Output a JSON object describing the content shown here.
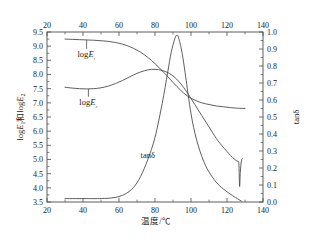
{
  "chart_data": {
    "type": "line",
    "title": "",
    "xlabel": "温度/℃",
    "ylabel": "logE₁和logE₂",
    "y2label": "tanδ",
    "xlim": [
      20,
      140
    ],
    "ylim": [
      3.5,
      9.5
    ],
    "y2lim": [
      0.0,
      1.0
    ],
    "grid": false,
    "legend_position": "inline-annotations",
    "xticks": [
      20,
      40,
      60,
      80,
      100,
      120,
      140
    ],
    "xticklabels": [
      "20",
      "40",
      "60",
      "80",
      "100",
      "120",
      "140"
    ],
    "xminorticks": [
      30,
      50,
      70,
      90,
      110,
      130
    ],
    "yticks": [
      3.5,
      4.0,
      4.5,
      5.0,
      5.5,
      6.0,
      6.5,
      7.0,
      7.5,
      8.0,
      8.5,
      9.0,
      9.5
    ],
    "yticklabels": [
      "3.5",
      "4.0",
      "4.5",
      "5.0",
      "5.5",
      "6.0",
      "6.5",
      "7.0",
      "7.5",
      "8.0",
      "8.5",
      "9.0",
      "9.5"
    ],
    "y2ticks": [
      0.0,
      0.1,
      0.2,
      0.3,
      0.4,
      0.5,
      0.6,
      0.7,
      0.8,
      0.9,
      1.0
    ],
    "y2ticklabels": [
      "0.0",
      "0.1",
      "0.2",
      "0.3",
      "0.4",
      "0.5",
      "0.6",
      "0.7",
      "0.8",
      "0.9",
      "1.0"
    ],
    "top_axis_shown": true,
    "bottom_axis_shown": true,
    "annotations": [
      {
        "text": "logE₁",
        "x": 42,
        "y": 8.62,
        "leader_to_y": 9.22
      },
      {
        "text": "logE₂",
        "x": 43,
        "y": 6.93,
        "leader_to_y": 7.49
      },
      {
        "text": "tanδ",
        "x": 76,
        "y": 5.05
      }
    ],
    "series": [
      {
        "name": "logE₁",
        "axis": "left",
        "x": [
          30,
          34,
          38,
          42,
          46,
          50,
          54,
          58,
          62,
          66,
          70,
          74,
          78,
          82,
          86,
          90,
          94,
          98,
          102,
          106,
          110,
          114,
          118,
          122,
          126,
          130
        ],
        "values": [
          9.25,
          9.24,
          9.23,
          9.22,
          9.21,
          9.19,
          9.17,
          9.13,
          9.07,
          8.98,
          8.86,
          8.7,
          8.5,
          8.26,
          8.0,
          7.72,
          7.46,
          7.24,
          7.1,
          7.0,
          6.94,
          6.89,
          6.86,
          6.83,
          6.81,
          6.8
        ]
      },
      {
        "name": "logE₂",
        "axis": "left",
        "x": [
          30,
          34,
          38,
          42,
          46,
          50,
          54,
          58,
          62,
          66,
          70,
          74,
          78,
          82,
          86,
          90,
          94,
          98,
          102,
          106,
          110,
          114,
          117,
          120,
          122,
          124,
          125,
          126,
          126.6,
          127,
          127.4,
          128,
          128.6
        ],
        "values": [
          7.55,
          7.52,
          7.5,
          7.49,
          7.5,
          7.53,
          7.59,
          7.68,
          7.79,
          7.92,
          8.04,
          8.13,
          8.18,
          8.17,
          8.1,
          7.95,
          7.7,
          7.35,
          6.95,
          6.55,
          6.15,
          5.75,
          5.5,
          5.28,
          5.14,
          5.02,
          4.97,
          4.93,
          4.85,
          4.05,
          4.55,
          4.95,
          5.03
        ]
      },
      {
        "name": "tanδ",
        "axis": "right",
        "x": [
          30,
          36,
          42,
          48,
          52,
          56,
          60,
          64,
          68,
          72,
          76,
          80,
          84,
          87,
          89,
          91,
          92,
          93,
          95,
          97,
          100,
          103,
          107,
          111,
          115,
          119,
          123,
          126,
          128
        ],
        "values": [
          0.02,
          0.02,
          0.02,
          0.02,
          0.021,
          0.024,
          0.032,
          0.05,
          0.085,
          0.15,
          0.25,
          0.38,
          0.58,
          0.76,
          0.88,
          0.96,
          0.98,
          0.97,
          0.88,
          0.74,
          0.52,
          0.37,
          0.24,
          0.16,
          0.105,
          0.068,
          0.038,
          0.018,
          0.005
        ]
      }
    ]
  },
  "axes": {
    "left_title": "logE₁和logE₂",
    "right_title": "tanδ",
    "bottom_title": "温度/℃"
  }
}
